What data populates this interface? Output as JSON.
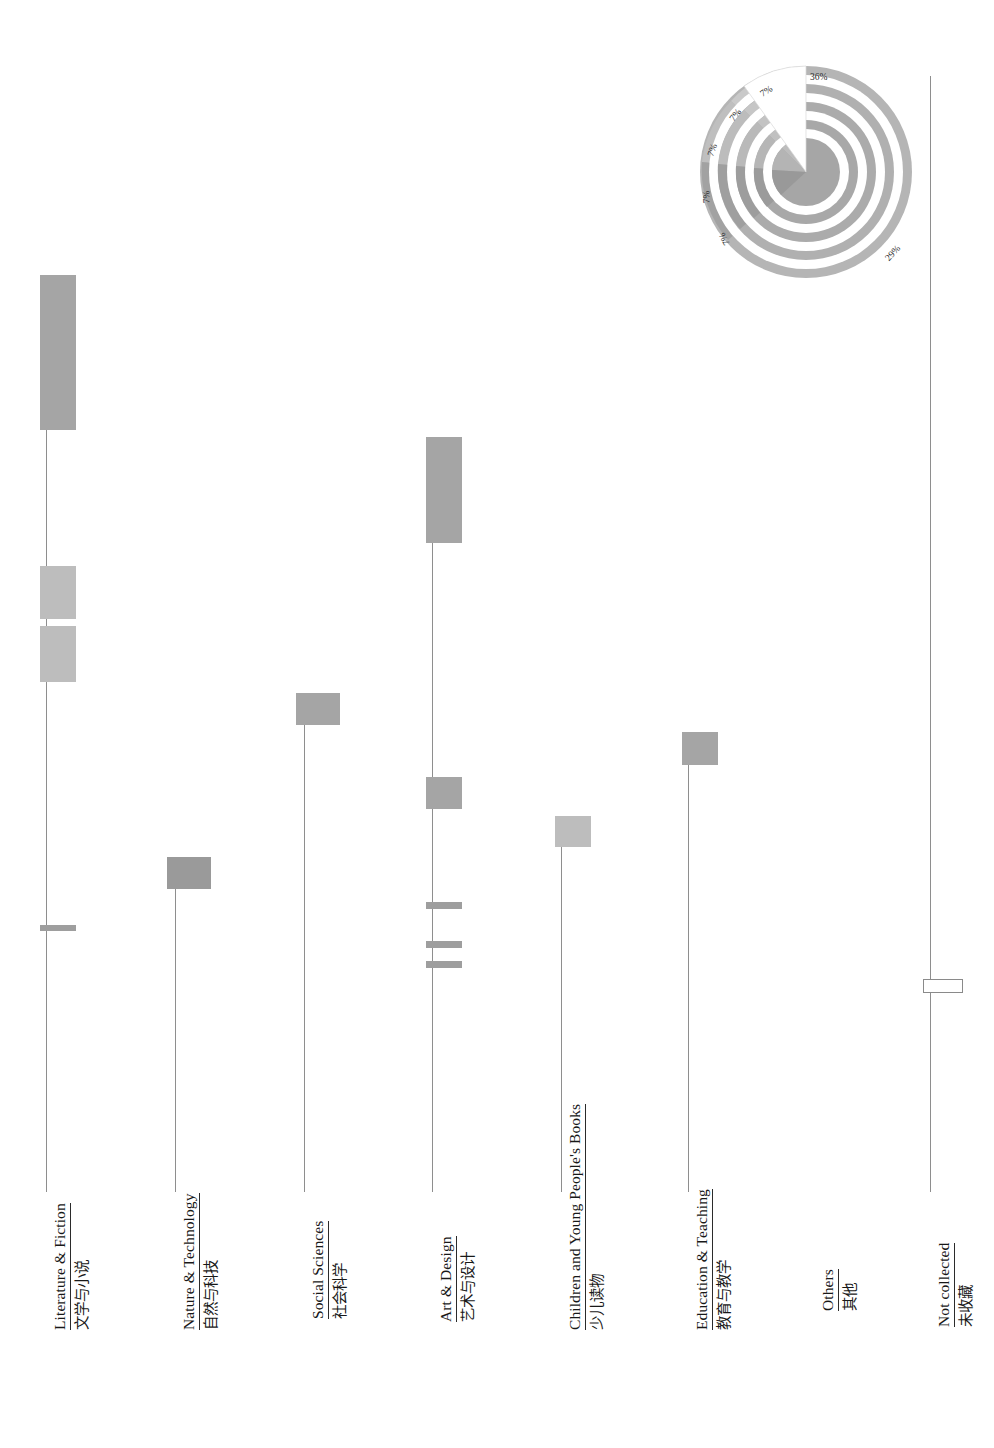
{
  "chart_data": {
    "type": "bar",
    "title": "",
    "subtitle": "",
    "xlabel": "",
    "ylabel": "",
    "orientation": "rotated-90",
    "grid": false,
    "legend": "none",
    "categories": [
      "Literature & Fiction",
      "Nature & Technology",
      "Social Sciences",
      "Art & Design",
      "Children and Young People's Books",
      "Education & Teaching",
      "Others",
      "Not collected"
    ],
    "categories_zh": [
      "文学与小说",
      "自然与科技",
      "社会科学",
      "艺术与设计",
      "少儿读物",
      "教育与教学",
      "其他",
      "未收藏"
    ],
    "series": [
      {
        "name": "Literature & Fiction",
        "bars": [
          {
            "value": 88,
            "top": 275,
            "height": 155,
            "width": 36,
            "shade": "mid"
          },
          {
            "value": 42,
            "top": 566,
            "height": 53,
            "width": 36,
            "shade": "light"
          },
          {
            "value": 41,
            "top": 626,
            "height": 56,
            "width": 36,
            "shade": "light"
          },
          {
            "value": 3,
            "top": 925,
            "height": 6,
            "width": 36,
            "shade": "thin"
          }
        ]
      },
      {
        "name": "Nature & Technology",
        "bars": [
          {
            "value": 24,
            "top": 857,
            "height": 32,
            "width": 44,
            "shade": "dark"
          }
        ]
      },
      {
        "name": "Social Sciences",
        "bars": [
          {
            "value": 23,
            "top": 693,
            "height": 32,
            "width": 44,
            "shade": "mid"
          }
        ]
      },
      {
        "name": "Art & Design",
        "bars": [
          {
            "value": 62,
            "top": 437,
            "height": 106,
            "width": 36,
            "shade": "mid"
          },
          {
            "value": 21,
            "top": 777,
            "height": 32,
            "width": 36,
            "shade": "mid"
          },
          {
            "value": 4,
            "top": 902,
            "height": 7,
            "width": 36,
            "shade": "thin"
          },
          {
            "value": 4,
            "top": 941,
            "height": 7,
            "width": 36,
            "shade": "thin"
          },
          {
            "value": 4,
            "top": 961,
            "height": 7,
            "width": 36,
            "shade": "thin"
          }
        ]
      },
      {
        "name": "Children and Young People's Books",
        "bars": [
          {
            "value": 20,
            "top": 816,
            "height": 31,
            "width": 36,
            "shade": "light"
          }
        ]
      },
      {
        "name": "Education & Teaching",
        "bars": [
          {
            "value": 22,
            "top": 732,
            "height": 33,
            "width": 36,
            "shade": "mid"
          }
        ]
      },
      {
        "name": "Others",
        "bars": []
      },
      {
        "name": "Not collected",
        "bars": [
          {
            "value": 2,
            "top": 979,
            "height": 12,
            "width": 38,
            "shade": "hollow"
          }
        ]
      }
    ],
    "axis_stems": [
      {
        "category": "Literature & Fiction",
        "x": 46,
        "top": 276,
        "bottom": 1192
      },
      {
        "category": "Nature & Technology",
        "x": 175,
        "top": 858,
        "bottom": 1192
      },
      {
        "category": "Social Sciences",
        "x": 304,
        "top": 694,
        "bottom": 1192
      },
      {
        "category": "Art & Design",
        "x": 432,
        "top": 438,
        "bottom": 1192
      },
      {
        "category": "Children and Young People's Books",
        "x": 561,
        "top": 817,
        "bottom": 1192
      },
      {
        "category": "Education & Teaching",
        "x": 688,
        "top": 733,
        "bottom": 1192
      },
      {
        "category": "Not collected",
        "x": 930,
        "top": 76,
        "bottom": 1192
      }
    ]
  },
  "polar_chart": {
    "type": "pie",
    "title": "",
    "labels": [
      "36%",
      "29%",
      "7%",
      "7%",
      "7%",
      "7%",
      "7%"
    ],
    "values": [
      36,
      29,
      7,
      7,
      7,
      7,
      7
    ],
    "rings": 5,
    "highlight_slice": "36%",
    "highlight_color": "#ffffff",
    "ring_colors": [
      "#b9b9b9",
      "#ababab",
      "#a0a0a0",
      "#9b9b9b",
      "#c2c2c2"
    ],
    "label_positions": [
      {
        "text": "36%",
        "x": 122,
        "y": 20,
        "rot": 0
      },
      {
        "text": "7%",
        "x": 72,
        "y": 34,
        "rot": -32
      },
      {
        "text": "7%",
        "x": 41,
        "y": 58,
        "rot": -52
      },
      {
        "text": "7%",
        "x": 18,
        "y": 93,
        "rot": -70
      },
      {
        "text": "7%",
        "x": 12,
        "y": 140,
        "rot": -92
      },
      {
        "text": "7%",
        "x": 30,
        "y": 182,
        "rot": -118
      },
      {
        "text": "29%",
        "x": 196,
        "y": 196,
        "rot": -48
      }
    ]
  },
  "label_layout": [
    {
      "x": 52,
      "y": 1330,
      "en": "Literature & Fiction",
      "zh": "文学与小说"
    },
    {
      "x": 181,
      "y": 1330,
      "en": "Nature & Technology",
      "zh": "自然与科技"
    },
    {
      "x": 310,
      "y": 1319,
      "en": "Social Sciences",
      "zh": "社会科学"
    },
    {
      "x": 438,
      "y": 1322,
      "en": "Art & Design",
      "zh": "艺术与设计"
    },
    {
      "x": 567,
      "y": 1330,
      "en": "Children and Young People's Books",
      "zh": "少儿读物"
    },
    {
      "x": 694,
      "y": 1330,
      "en": "Education & Teaching",
      "zh": "教育与教学"
    },
    {
      "x": 820,
      "y": 1311,
      "en": "Others",
      "zh": "其他"
    },
    {
      "x": 936,
      "y": 1327,
      "en": "Not collected",
      "zh": "未收藏"
    }
  ],
  "colors": {
    "bar_mid": "#a8a8a8",
    "bar_light": "#bdbdbd",
    "bar_dark": "#9a9a9a",
    "stem": "#8e8e8e",
    "text": "#181818",
    "background": "#ffffff"
  }
}
